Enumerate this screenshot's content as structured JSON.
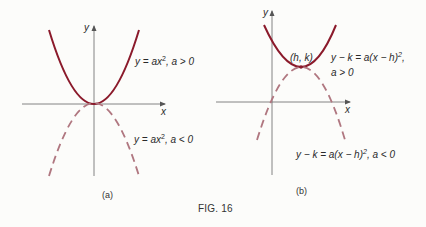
{
  "figure": {
    "caption": "FIG. 16",
    "colors": {
      "curve_solid": "#8b1a2b",
      "curve_dashed": "#b07780",
      "axis": "#555555",
      "text": "#2a2a2a"
    },
    "panels": [
      {
        "id": "a",
        "sublabel": "(a)",
        "axes": {
          "x_label": "x",
          "y_label": "y"
        },
        "curves": [
          {
            "style": "solid",
            "label_lhs": "y",
            "label_rhs": "= ax",
            "exponent": "2",
            "condition": ", a > 0"
          },
          {
            "style": "dashed",
            "label_lhs": "y",
            "label_rhs": "= ax",
            "exponent": "2",
            "condition": ", a < 0"
          }
        ]
      },
      {
        "id": "b",
        "sublabel": "(b)",
        "axes": {
          "x_label": "x",
          "y_label": "y"
        },
        "vertex_label": "(h, k)",
        "curves": [
          {
            "style": "solid",
            "label_main": "y − k = a(x − h)",
            "exponent": "2",
            "suffix": ",",
            "condition": "a > 0"
          },
          {
            "style": "dashed",
            "label_main": "y − k = a(x − h)",
            "exponent": "2",
            "condition": ", a < 0"
          }
        ]
      }
    ]
  }
}
